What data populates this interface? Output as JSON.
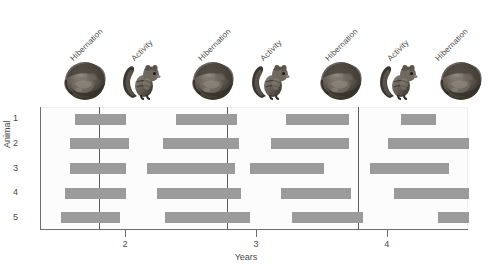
{
  "figure": {
    "ylabel": "Animal",
    "xlabel": "Years",
    "phase_labels": [
      {
        "text": "Hibernation",
        "x": 75,
        "y": 54
      },
      {
        "text": "Activity",
        "x": 136,
        "y": 54
      },
      {
        "text": "Hibernation",
        "x": 203,
        "y": 54
      },
      {
        "text": "Activity",
        "x": 265,
        "y": 54
      },
      {
        "text": "Hibernation",
        "x": 330,
        "y": 54
      },
      {
        "text": "Activity",
        "x": 392,
        "y": 54
      },
      {
        "text": "Hibernation",
        "x": 440,
        "y": 54
      }
    ],
    "icons": [
      {
        "name": "hibernating-squirrel-icon",
        "state": "hibernation",
        "x": 62,
        "y": 58
      },
      {
        "name": "active-squirrel-icon",
        "state": "activity",
        "x": 120,
        "y": 58
      },
      {
        "name": "hibernating-squirrel-icon",
        "state": "hibernation",
        "x": 190,
        "y": 58
      },
      {
        "name": "active-squirrel-icon",
        "state": "activity",
        "x": 249,
        "y": 58
      },
      {
        "name": "hibernating-squirrel-icon",
        "state": "hibernation",
        "x": 318,
        "y": 58
      },
      {
        "name": "active-squirrel-icon",
        "state": "activity",
        "x": 377,
        "y": 58
      },
      {
        "name": "hibernating-squirrel-icon",
        "state": "hibernation",
        "x": 438,
        "y": 58
      }
    ],
    "colors": {
      "bar": "#9b9b9b",
      "axis": "#6e6e6e",
      "reference_line": "#5c5c5c",
      "text": "#4a4a4a",
      "plot_background": "#fcfcfc"
    }
  },
  "chart_data": {
    "type": "bar",
    "orientation": "horizontal",
    "title": "",
    "xlabel": "Years",
    "ylabel": "Animal",
    "xlim": [
      1.35,
      4.62
    ],
    "xticks": [
      2,
      3,
      4
    ],
    "xticklabels": [
      "2",
      "3",
      "4"
    ],
    "yticks": [
      1,
      2,
      3,
      4,
      5
    ],
    "yticklabels": [
      "1",
      "2",
      "3",
      "4",
      "5"
    ],
    "grid": false,
    "legend": null,
    "reference_lines": [
      1.79,
      2.77,
      3.77
    ],
    "series": [
      {
        "name": "Hibernation bout",
        "animal_rows": [
          {
            "animal": "1",
            "bouts": [
              {
                "start": 1.61,
                "end": 2.0
              },
              {
                "start": 2.38,
                "end": 2.85
              },
              {
                "start": 3.22,
                "end": 3.7
              },
              {
                "start": 4.1,
                "end": 4.37
              }
            ]
          },
          {
            "animal": "2",
            "bouts": [
              {
                "start": 1.57,
                "end": 2.02
              },
              {
                "start": 2.28,
                "end": 2.86
              },
              {
                "start": 3.11,
                "end": 3.7
              },
              {
                "start": 4.0,
                "end": 4.62
              }
            ]
          },
          {
            "animal": "3",
            "bouts": [
              {
                "start": 1.57,
                "end": 2.0
              },
              {
                "start": 2.16,
                "end": 2.83
              },
              {
                "start": 2.95,
                "end": 3.51
              },
              {
                "start": 3.86,
                "end": 4.47
              }
            ]
          },
          {
            "animal": "4",
            "bouts": [
              {
                "start": 1.53,
                "end": 2.0
              },
              {
                "start": 2.24,
                "end": 2.88
              },
              {
                "start": 3.18,
                "end": 3.72
              },
              {
                "start": 4.05,
                "end": 4.62
              }
            ]
          },
          {
            "animal": "5",
            "bouts": [
              {
                "start": 1.5,
                "end": 1.95
              },
              {
                "start": 2.3,
                "end": 2.95
              },
              {
                "start": 3.27,
                "end": 3.81
              },
              {
                "start": 4.38,
                "end": 4.62
              }
            ]
          }
        ]
      }
    ]
  }
}
